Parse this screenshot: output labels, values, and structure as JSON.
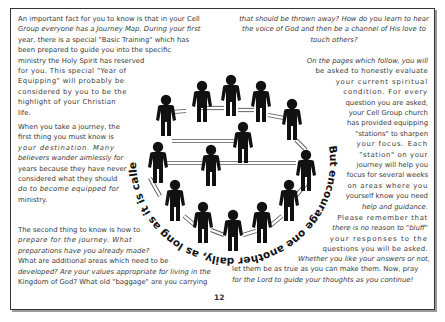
{
  "page": {
    "number": "12",
    "circle_verse": "But encourage one another daily, as long as it is called Today, so that none of you may be hardened by sin's deceitfulness."
  },
  "left_column": {
    "p1": [
      "An important fact for you to know is that in your Cell",
      "Group everyone has a Journey Map. During your first",
      "year, there is a special \"Basic Training\" which has",
      "been prepared to guide you into the specific",
      "ministry the Holy Spirit has reserved",
      "for you. This special \"Year of",
      "Equipping\" will probably be",
      "considered by you to be the",
      "highlight of your Christian",
      "life."
    ],
    "p2": [
      "When you take a journey, the",
      "first thing you must know is",
      "your destination. Many",
      "believers wander aimlessly for",
      "years because they have never",
      "considered what they should",
      "do to become equipped for",
      "ministry."
    ],
    "p3": [
      "The second thing to know is how to",
      "prepare for the journey. What",
      "preparations have you already made?",
      "What are additional areas which need to be",
      "developed? Are your values appropriate for living in the",
      "Kingdom of God? What old \"baggage\" are you carrying"
    ]
  },
  "right_column": {
    "p1": [
      "that should be thrown away? How do you learn to hear",
      "the voice of God and then be a channel of His love to",
      "touch others?"
    ],
    "p2": [
      "On the pages which follow, you will",
      "be asked to honestly evaluate",
      "your current spiritual",
      "condition. For every",
      "question you are asked,",
      "your Cell Group church",
      "has provided equipping",
      "\"stations\" to sharpen",
      "your focus. Each",
      "\"station\" on your",
      "journey will help you",
      "focus for several weeks",
      "on areas where you",
      "yourself know you need",
      "help and guidance."
    ],
    "p3": [
      "Please remember that",
      "there is no reason to \"bluff\"",
      "your responses to the",
      "questions you will be asked.",
      "Whether you like your answers or not,",
      "let them be as true as you can make them. Now, pray",
      "for the Lord to guide your thoughts as you continue!"
    ]
  },
  "illustration": {
    "description": "Circle of people figures connected by arrows with verse text around the circle",
    "figure_count": 15,
    "figure_color": "#111111",
    "arrow_color": "#ffffff"
  }
}
